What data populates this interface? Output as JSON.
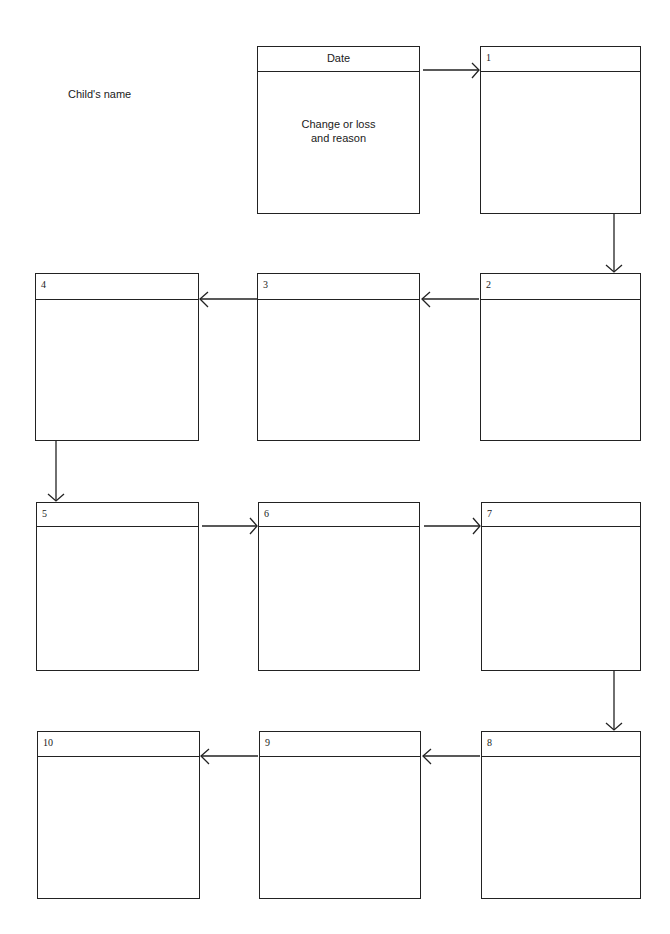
{
  "form": {
    "childs_name_label": "Child's name",
    "key_box": {
      "header": "Date",
      "body": "Change or loss\nand reason"
    },
    "boxes": [
      {
        "number": "1"
      },
      {
        "number": "2"
      },
      {
        "number": "3"
      },
      {
        "number": "4"
      },
      {
        "number": "5"
      },
      {
        "number": "6"
      },
      {
        "number": "7"
      },
      {
        "number": "8"
      },
      {
        "number": "9"
      },
      {
        "number": "10"
      }
    ],
    "flow_order": [
      "key",
      "1",
      "2",
      "3",
      "4",
      "5",
      "6",
      "7",
      "8",
      "9",
      "10"
    ]
  }
}
